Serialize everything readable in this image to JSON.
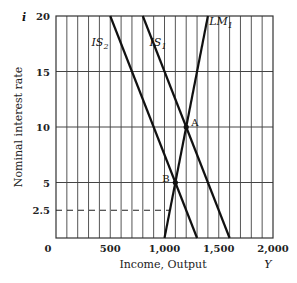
{
  "chart_data": {
    "type": "line",
    "title": "",
    "xlabel": "Income, Output",
    "xlabel_symbol": "Y",
    "ylabel": "Nominal interest rate",
    "ylabel_symbol": "i",
    "xlim": [
      0,
      2000
    ],
    "ylim": [
      0,
      20
    ],
    "x_ticks": [
      0,
      500,
      1000,
      1500,
      2000
    ],
    "x_tick_labels": [
      "0",
      "500",
      "1,000",
      "1,500",
      "2,000"
    ],
    "y_ticks": [
      2.5,
      5,
      10,
      15,
      20
    ],
    "y_tick_labels": [
      "2.5",
      "5",
      "10",
      "15",
      "20"
    ],
    "grid": {
      "vertical_every": 100,
      "horizontal_at": [
        5,
        10,
        15
      ]
    },
    "series": [
      {
        "name": "IS2",
        "label": "IS",
        "sub": "2",
        "points": [
          [
            500,
            20
          ],
          [
            1300,
            0
          ]
        ]
      },
      {
        "name": "IS1",
        "label": "IS",
        "sub": "1",
        "points": [
          [
            800,
            20
          ],
          [
            1600,
            0
          ]
        ]
      },
      {
        "name": "LM1",
        "label": "LM",
        "sub": "1",
        "points": [
          [
            1000,
            0
          ],
          [
            1400,
            20
          ]
        ]
      }
    ],
    "points": [
      {
        "label": "A",
        "x": 1200,
        "y": 10
      },
      {
        "label": "B",
        "x": 1100,
        "y": 5
      }
    ],
    "dashed_lines": [
      {
        "y": 2.5,
        "x_from": 0,
        "x_to": 1050
      }
    ]
  }
}
